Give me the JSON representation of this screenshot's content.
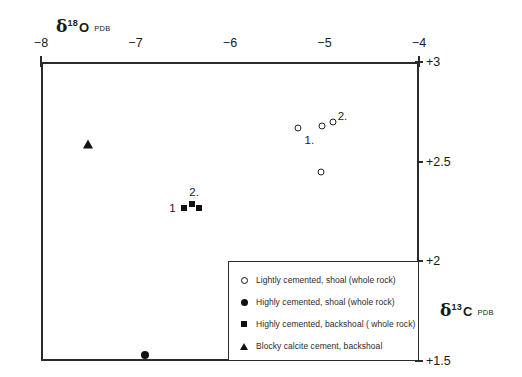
{
  "chart_data": {
    "type": "scatter",
    "title": "",
    "xlabel": "δ18O PDB",
    "ylabel": "δ13C PDB",
    "xlim": [
      -8,
      -4
    ],
    "ylim": [
      1.5,
      3
    ],
    "x_ticks": [
      -8,
      -7,
      -6,
      -5,
      -4
    ],
    "x_tick_labels": [
      "−8",
      "−7",
      "−6",
      "−5",
      "−4"
    ],
    "y_ticks": [
      3,
      2.5,
      2,
      1.5
    ],
    "y_tick_labels": [
      "+3",
      "+2.5",
      "+2",
      "+1.5"
    ],
    "grid": false,
    "x_axis_position": "top",
    "y_axis_position": "right",
    "legend_position": "bottom-right inside",
    "series": [
      {
        "name": "Lightly cemented, shoal (whole rock)",
        "marker": "open-circle",
        "points": [
          {
            "x": -5.28,
            "y": 2.67
          },
          {
            "x": -5.03,
            "y": 2.68
          },
          {
            "x": -4.91,
            "y": 2.7
          },
          {
            "x": -5.04,
            "y": 2.45
          }
        ]
      },
      {
        "name": "Highly cemented, shoal (whole rock)",
        "marker": "filled-circle",
        "points": [
          {
            "x": -6.9,
            "y": 1.53
          }
        ]
      },
      {
        "name": "Highly cemented, backshoal ( whole rock)",
        "marker": "filled-square",
        "points": [
          {
            "x": -6.49,
            "y": 2.27
          },
          {
            "x": -6.4,
            "y": 2.29
          },
          {
            "x": -6.33,
            "y": 2.27
          }
        ]
      },
      {
        "name": "Blocky calcite cement, backshoal",
        "marker": "filled-triangle",
        "points": [
          {
            "x": -7.5,
            "y": 2.59
          }
        ]
      }
    ],
    "annotations": [
      {
        "text": "1.",
        "x": -5.16,
        "y": 2.61
      },
      {
        "text": "2.",
        "x": -4.81,
        "y": 2.73
      },
      {
        "text": "1",
        "x": -6.61,
        "y": 2.27
      },
      {
        "text": "2.",
        "x": -6.38,
        "y": 2.35
      }
    ]
  },
  "axes": {
    "x_title": {
      "delta": "δ",
      "superscript": "18",
      "element": "O",
      "standard": "PDB"
    },
    "y_title": {
      "delta": "δ",
      "superscript": "13",
      "element": "C",
      "standard": "PDB"
    }
  },
  "legend": {
    "items": [
      {
        "marker": "open-circle",
        "label": "Lightly cemented, shoal (whole rock)"
      },
      {
        "marker": "filled-circle",
        "label": "Highly cemented, shoal (whole rock)"
      },
      {
        "marker": "filled-square",
        "label": "Highly cemented, backshoal ( whole rock)"
      },
      {
        "marker": "filled-triangle",
        "label": "Blocky calcite cement, backshoal"
      }
    ]
  },
  "colors": {
    "axis": "#2b2b2b",
    "marker": "#111111",
    "background": "#ffffff"
  }
}
